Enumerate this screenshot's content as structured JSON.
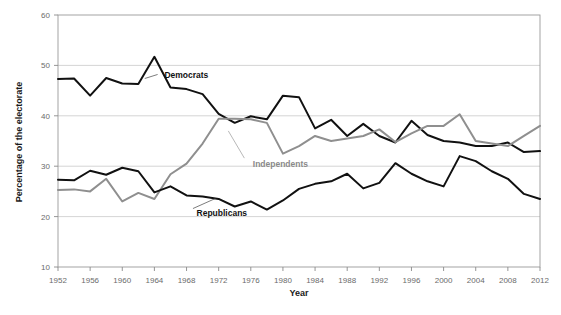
{
  "chart_data": {
    "type": "line",
    "title": "",
    "xlabel": "Year",
    "ylabel": "Percentage of the electorate",
    "xlim": [
      1952,
      2012
    ],
    "ylim": [
      10,
      60
    ],
    "ytick_labels": [
      "10",
      "20",
      "30",
      "40",
      "50",
      "60"
    ],
    "yticks": [
      10,
      20,
      30,
      40,
      50,
      60
    ],
    "xtick_labels": [
      "1952",
      "1956",
      "1960",
      "1964",
      "1968",
      "1972",
      "1976",
      "1980",
      "1984",
      "1988",
      "1992",
      "1996",
      "2000",
      "2004",
      "2008",
      "2012"
    ],
    "xticks": [
      1952,
      1956,
      1960,
      1964,
      1968,
      1972,
      1976,
      1980,
      1984,
      1988,
      1992,
      1996,
      2000,
      2004,
      2008,
      2012
    ],
    "grid": true,
    "legend_position": "inline-annotations",
    "x": [
      1952,
      1954,
      1956,
      1958,
      1960,
      1962,
      1964,
      1966,
      1968,
      1970,
      1972,
      1974,
      1976,
      1978,
      1980,
      1982,
      1984,
      1986,
      1988,
      1990,
      1992,
      1994,
      1996,
      1998,
      2000,
      2002,
      2004,
      2006,
      2008,
      2010,
      2012
    ],
    "series": [
      {
        "name": "Democrats",
        "color": "#111111",
        "label_text": "Democrats",
        "values": [
          47.3,
          47.4,
          44.0,
          47.5,
          46.4,
          46.3,
          51.7,
          45.6,
          45.3,
          44.3,
          40.4,
          38.6,
          39.9,
          39.3,
          44.0,
          43.7,
          37.5,
          39.2,
          36.0,
          38.4,
          36.0,
          34.7,
          39.0,
          36.2,
          35.0,
          34.7,
          34.0,
          34.0,
          34.7,
          32.8,
          33.0
        ]
      },
      {
        "name": "Independents",
        "color": "#8f8f8f",
        "label_text": "Independents",
        "values": [
          25.3,
          25.4,
          25.0,
          27.5,
          23.0,
          24.7,
          23.5,
          28.4,
          30.5,
          34.5,
          39.4,
          39.4,
          39.3,
          38.6,
          32.5,
          34.0,
          36.0,
          35.0,
          35.5,
          36.0,
          37.3,
          34.8,
          36.5,
          38.0,
          38.0,
          40.3,
          35.0,
          34.5,
          34.0,
          36.0,
          38.0
        ]
      },
      {
        "name": "Republicans",
        "color": "#111111",
        "label_text": "Republicans",
        "values": [
          27.3,
          27.2,
          29.1,
          28.3,
          29.7,
          29.0,
          24.8,
          26.0,
          24.2,
          24.0,
          23.5,
          22.0,
          23.0,
          21.4,
          23.2,
          25.5,
          26.5,
          27.0,
          28.5,
          25.6,
          26.7,
          30.6,
          28.5,
          27.0,
          26.0,
          32.0,
          31.0,
          29.0,
          27.5,
          24.5,
          23.5
        ]
      }
    ],
    "annotations": [
      {
        "text": "Democrats",
        "x": 1964,
        "y": 48.0
      },
      {
        "text": "Independents",
        "x": 1975,
        "y": 30.5
      },
      {
        "text": "Republicans",
        "x": 1968,
        "y": 20.8
      }
    ]
  }
}
